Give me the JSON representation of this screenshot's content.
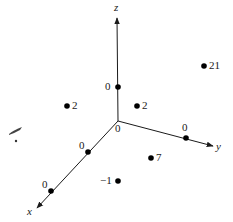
{
  "figure": {
    "type": "3d-axes-point-diagram",
    "colors": {
      "background": "#ffffff",
      "axis": "#1a1a1a",
      "point": "#000000",
      "text": "#1a1a1a"
    },
    "origin": {
      "label": "0",
      "px": [
        118,
        121
      ]
    },
    "axes": [
      {
        "id": "z",
        "label": "z",
        "end_px": [
          117,
          18
        ],
        "label_px": [
          114,
          2
        ]
      },
      {
        "id": "y",
        "label": "y",
        "end_px": [
          213,
          146
        ],
        "label_px": [
          216,
          141
        ]
      },
      {
        "id": "x",
        "label": "x",
        "end_px": [
          37,
          208
        ],
        "label_px": [
          27,
          206
        ]
      }
    ],
    "axis_ticks": [
      {
        "axis": "z",
        "label": "0",
        "px": [
          118,
          87
        ],
        "label_px": [
          105,
          81
        ]
      },
      {
        "axis": "y",
        "label": "0",
        "px": [
          186,
          138
        ],
        "label_px": [
          182,
          122
        ]
      },
      {
        "axis": "x",
        "label": "0",
        "px": [
          88,
          152
        ],
        "label_px": [
          79,
          140
        ]
      },
      {
        "axis": "x",
        "label": "0",
        "px": [
          51,
          191
        ],
        "label_px": [
          42,
          179
        ]
      }
    ],
    "points": [
      {
        "label": "2",
        "px": [
          67,
          106
        ],
        "label_px": [
          72,
          100
        ]
      },
      {
        "label": "2",
        "px": [
          137,
          106
        ],
        "label_px": [
          142,
          100
        ]
      },
      {
        "label": "21",
        "px": [
          204,
          66
        ],
        "label_px": [
          209,
          60
        ]
      },
      {
        "label": "7",
        "px": [
          151,
          158
        ],
        "label_px": [
          156,
          152
        ]
      },
      {
        "label": "−1",
        "px": [
          118,
          181
        ],
        "label_px": [
          100,
          175
        ]
      }
    ],
    "origin_label_px": [
      115,
      123
    ]
  }
}
